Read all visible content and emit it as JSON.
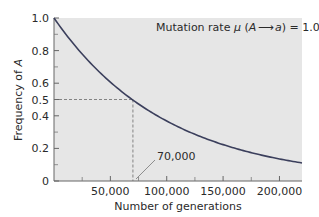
{
  "chart_data": {
    "type": "line",
    "title": "",
    "xlabel": "Number of generations",
    "ylabel": "Frequency of A",
    "xlim": [
      0,
      220000
    ],
    "ylim": [
      0,
      1.0
    ],
    "grid": false,
    "legend": null,
    "x_ticks": [
      50000,
      100000,
      150000,
      200000
    ],
    "x_tick_labels": [
      "50,000",
      "100,000",
      "150,000",
      "200,000"
    ],
    "x_minor_ticks": [
      25000,
      75000,
      125000,
      175000
    ],
    "y_ticks": [
      0,
      0.2,
      0.4,
      0.5,
      0.6,
      0.8,
      1.0
    ],
    "y_tick_labels": [
      "0",
      "0.2",
      "0.4",
      "0.5",
      "0.6",
      "0.8",
      "1.0"
    ],
    "y_minor_ticks": [
      0.1,
      0.3,
      0.7,
      0.9
    ],
    "series": [
      {
        "name": "Frequency of A",
        "formula": "p = exp(-mu * t), mu = 1.0e-5",
        "x": [
          0,
          20000,
          40000,
          60000,
          70000,
          80000,
          100000,
          120000,
          140000,
          160000,
          180000,
          200000,
          220000
        ],
        "y": [
          1.0,
          0.82,
          0.67,
          0.55,
          0.5,
          0.45,
          0.37,
          0.3,
          0.25,
          0.2,
          0.17,
          0.14,
          0.11
        ]
      }
    ],
    "annotations": [
      {
        "text": "Mutation rate μ (A ⟶ a) = 1.0 × 10⁻⁵",
        "type": "label"
      },
      {
        "text": "70,000",
        "type": "callout",
        "x": 70000,
        "y": 0
      },
      {
        "type": "dashed-guide",
        "from": [
          0,
          0.5
        ],
        "to": [
          70000,
          0.5
        ]
      },
      {
        "type": "dashed-guide",
        "from": [
          70000,
          0.5
        ],
        "to": [
          70000,
          0
        ]
      }
    ]
  },
  "labels": {
    "mutation_prefix": "Mutation rate ",
    "mu": "μ",
    "arrow_open": " (",
    "A": "A",
    "a": "a",
    "arrow_close": ") = 1.0 × 10",
    "exponent": "-5",
    "callout": "70,000",
    "xlabel": "Number of generations",
    "ylabel_prefix": "Frequency of ",
    "ylabel_italic": "A"
  },
  "colors": {
    "plot_bg": "#e6e6e6",
    "curve": "#3b3f5c",
    "axis": "#555555",
    "dashed": "#666666"
  }
}
